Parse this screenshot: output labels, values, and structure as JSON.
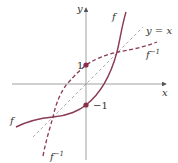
{
  "figure": {
    "type": "function-inverse-graph",
    "axes": {
      "x_label": "x",
      "y_label": "y"
    },
    "labels": {
      "f_top": "f",
      "f_left": "f",
      "finv_right": "f",
      "finv_right_sup": "−1",
      "finv_bottom": "f",
      "finv_bottom_sup": "−1",
      "identity_line": "y = x",
      "point_upper": "1",
      "point_lower": "−1"
    },
    "points": [
      {
        "name": "f-inverse-y-intercept",
        "x": 0,
        "y": 1
      },
      {
        "name": "f-y-intercept",
        "x": 0,
        "y": -1
      }
    ],
    "curves": [
      {
        "name": "f",
        "style": "solid"
      },
      {
        "name": "f^-1",
        "style": "dashed"
      },
      {
        "name": "y = x",
        "style": "thin-dashed"
      }
    ],
    "colors": {
      "curve": "#8a3a55",
      "point": "#8a2e4a",
      "axis": "#777777",
      "identity": "#888888",
      "text": "#333333"
    }
  }
}
